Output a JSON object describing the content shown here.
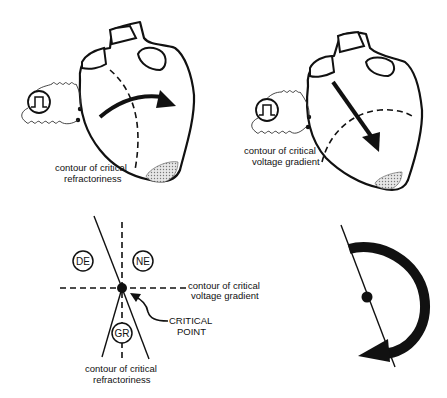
{
  "panels": {
    "top_left": {
      "label_line1": "contour of critical",
      "label_line2": "refractoriness"
    },
    "top_right": {
      "label_line1": "contour of critical",
      "label_line2": "voltage gradient"
    },
    "bottom_left": {
      "regions": [
        "DE",
        "NE",
        "GR"
      ],
      "region_de": "DE",
      "region_ne": "NE",
      "region_gr": "GR",
      "horizontal_label_line1": "contour of critical",
      "horizontal_label_line2": "voltage gradient",
      "bottom_label_line1": "contour of critical",
      "bottom_label_line2": "refractoriness",
      "point_label_line1": "CRITICAL",
      "point_label_line2": "POINT"
    },
    "bottom_right": {
      "description": "rotating reentrant wave around critical point"
    }
  },
  "colors": {
    "ink": "#111111",
    "shading": "#c8c8c8",
    "background": "#ffffff"
  }
}
